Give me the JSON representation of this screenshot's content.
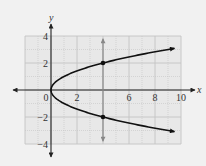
{
  "chart_data": {
    "type": "line",
    "title": "",
    "xlabel": "x",
    "ylabel": "y",
    "xlim": [
      -2,
      10
    ],
    "ylim": [
      -4,
      4
    ],
    "grid": true,
    "grid_minor_step": 1,
    "grid_major_step": 2,
    "x_ticks": [
      {
        "value": 0,
        "label": "0"
      },
      {
        "value": 2,
        "label": "2"
      },
      {
        "value": 6,
        "label": "6"
      },
      {
        "value": 8,
        "label": "8"
      },
      {
        "value": 10,
        "label": "10"
      }
    ],
    "y_ticks": [
      {
        "value": 4,
        "label": "4"
      },
      {
        "value": 2,
        "label": "2"
      },
      {
        "value": -2,
        "label": "−2"
      },
      {
        "value": -4,
        "label": "−4"
      }
    ],
    "series": [
      {
        "name": "x = y^2 (upper branch, y = sqrt(x))",
        "function": "sqrt",
        "sign": 1,
        "x_range": [
          0,
          9.5
        ],
        "color": "#111111"
      },
      {
        "name": "x = y^2 (lower branch, y = -sqrt(x))",
        "function": "sqrt",
        "sign": -1,
        "x_range": [
          0,
          9.5
        ],
        "color": "#111111"
      }
    ],
    "vertical_line": {
      "x": 4,
      "y_range": [
        -3.8,
        3.8
      ],
      "color": "#888888"
    },
    "points": [
      {
        "x": 4,
        "y": 2
      },
      {
        "x": 4,
        "y": -2
      }
    ],
    "colors": {
      "background": "#e8e8e8",
      "grid": "#c4c4c4",
      "axis": "#222222"
    }
  }
}
